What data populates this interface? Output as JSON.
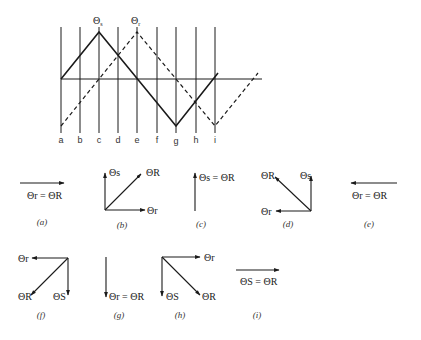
{
  "waveform": {
    "peak_labels": {
      "stator": {
        "sym": "Θ",
        "sub": "s"
      },
      "rotor": {
        "sym": "Θ",
        "sub": "r"
      }
    },
    "positions": [
      "a",
      "b",
      "c",
      "d",
      "e",
      "f",
      "g",
      "h",
      "i"
    ],
    "series": [
      {
        "name": "Θs (stator)",
        "style": "solid"
      },
      {
        "name": "Θr (rotor)",
        "style": "dashed"
      }
    ]
  },
  "phasors": [
    {
      "caption": "(a)",
      "label": "Θr = ΘR"
    },
    {
      "caption": "(b)",
      "labels": [
        "Θs",
        "ΘR",
        "Θr"
      ]
    },
    {
      "caption": "(c)",
      "label": "Θs = ΘR"
    },
    {
      "caption": "(d)",
      "labels": [
        "ΘR",
        "Θs",
        "Θr"
      ]
    },
    {
      "caption": "(e)",
      "label": "Θr = ΘR"
    },
    {
      "caption": "(f)",
      "labels": [
        "Θr",
        "ΘR",
        "ΘS"
      ]
    },
    {
      "caption": "(g)",
      "label": "Θr = ΘR"
    },
    {
      "caption": "(h)",
      "labels": [
        "Θr",
        "ΘS",
        "ΘR"
      ]
    },
    {
      "caption": "(i)",
      "label": "ΘS = ΘR"
    }
  ]
}
